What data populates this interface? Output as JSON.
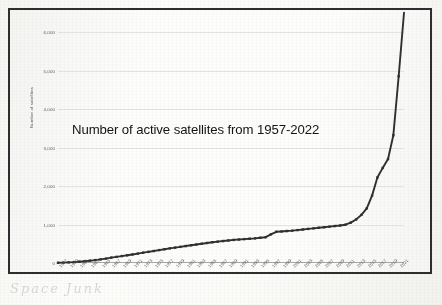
{
  "figure": {
    "kind": "scanned-line-chart-photo",
    "handwritten_note": "Space Junk"
  },
  "chart_data": {
    "type": "line",
    "title": "Number of active satellites from 1957-2022",
    "xlabel": "",
    "ylabel": "Number of satellites",
    "ylim": [
      0,
      6000
    ],
    "yticks": [
      0,
      1000,
      2000,
      3000,
      4000,
      5000,
      6000
    ],
    "ytick_labels": [
      "0",
      "1,000",
      "2,000",
      "3,000",
      "4,000",
      "5,000",
      "6,000"
    ],
    "grid": true,
    "legend": "none",
    "line_color": "#303030",
    "marker": "square",
    "xtick_labels": [
      "1957",
      "1959",
      "1961",
      "1963",
      "1965",
      "1967",
      "1969",
      "1971",
      "1973",
      "1975",
      "1977",
      "1979",
      "1981",
      "1983",
      "1985",
      "1987",
      "1989",
      "1991",
      "1993",
      "1995",
      "1997",
      "1999",
      "2001",
      "2003",
      "2005",
      "2007",
      "2009",
      "2011",
      "2013",
      "2015",
      "2017",
      "2019",
      "2021"
    ],
    "x": [
      1957,
      1958,
      1959,
      1960,
      1961,
      1962,
      1963,
      1964,
      1965,
      1966,
      1967,
      1968,
      1969,
      1970,
      1971,
      1972,
      1973,
      1974,
      1975,
      1976,
      1977,
      1978,
      1979,
      1980,
      1981,
      1982,
      1983,
      1984,
      1985,
      1986,
      1987,
      1988,
      1989,
      1990,
      1991,
      1992,
      1993,
      1994,
      1995,
      1996,
      1997,
      1998,
      1999,
      2000,
      2001,
      2002,
      2003,
      2004,
      2005,
      2006,
      2007,
      2008,
      2009,
      2010,
      2011,
      2012,
      2013,
      2014,
      2015,
      2016,
      2017,
      2018,
      2019,
      2020,
      2021,
      2022
    ],
    "values": [
      5,
      10,
      16,
      24,
      34,
      46,
      60,
      76,
      95,
      115,
      140,
      160,
      180,
      200,
      222,
      245,
      268,
      290,
      312,
      335,
      358,
      380,
      400,
      420,
      440,
      460,
      480,
      500,
      520,
      540,
      555,
      570,
      585,
      600,
      610,
      620,
      630,
      640,
      655,
      670,
      745,
      810,
      820,
      830,
      840,
      855,
      870,
      885,
      900,
      915,
      930,
      945,
      960,
      975,
      995,
      1050,
      1130,
      1250,
      1420,
      1750,
      2220,
      2470,
      2700,
      3320,
      4850,
      6500
    ]
  }
}
